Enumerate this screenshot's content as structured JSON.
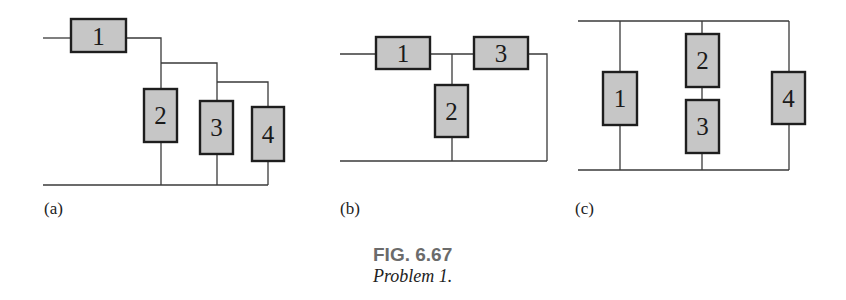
{
  "figure": {
    "number": "FIG. 6.67",
    "caption": "Problem 1."
  },
  "circuits": {
    "a": {
      "label": "(a)",
      "resistors": [
        "1",
        "2",
        "3",
        "4"
      ]
    },
    "b": {
      "label": "(b)",
      "resistors": [
        "1",
        "2",
        "3"
      ]
    },
    "c": {
      "label": "(c)",
      "resistors": [
        "1",
        "2",
        "3",
        "4"
      ]
    }
  },
  "colors": {
    "resistor_fill": "#c6c6c6",
    "resistor_border": "#1e1e1e",
    "wire": "#3a3a3a",
    "fig_label": "#6b6b6b"
  }
}
